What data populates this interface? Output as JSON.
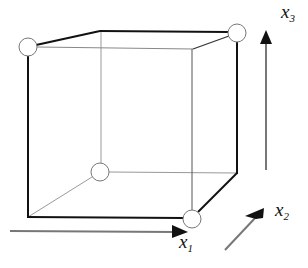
{
  "diagram": {
    "type": "cube-design-space",
    "axes": [
      {
        "id": "x1",
        "base": "x",
        "subscript": "1",
        "direction": "right"
      },
      {
        "id": "x2",
        "base": "x",
        "subscript": "2",
        "direction": "depth"
      },
      {
        "id": "x3",
        "base": "x",
        "subscript": "3",
        "direction": "up"
      }
    ],
    "design_points": [
      {
        "name": "front-top-left",
        "coords": [
          -1,
          -1,
          1
        ]
      },
      {
        "name": "back-top-right",
        "coords": [
          1,
          1,
          1
        ]
      },
      {
        "name": "back-bottom-left",
        "coords": [
          -1,
          1,
          -1
        ]
      },
      {
        "name": "front-bottom-right",
        "coords": [
          1,
          -1,
          -1
        ]
      }
    ],
    "colors": {
      "edge_bold": "#111111",
      "edge_thin": "#888888",
      "marker_fill": "#ffffff",
      "marker_stroke": "#777777"
    }
  }
}
